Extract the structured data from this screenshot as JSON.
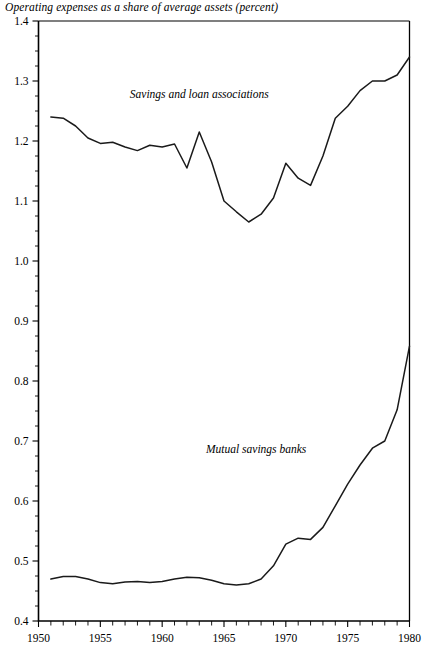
{
  "chart_data": {
    "type": "line",
    "title": "Operating expenses as a share of average assets (percent)",
    "xlabel": "",
    "ylabel": "",
    "xlim": [
      1950,
      1980
    ],
    "ylim": [
      0.4,
      1.4
    ],
    "grid": false,
    "legend_position": "inline-annotations",
    "x_ticks_major": [
      1950,
      1955,
      1960,
      1965,
      1970,
      1975,
      1980
    ],
    "x_tick_labels": [
      "1950",
      "1955",
      "1960",
      "1965",
      "1970",
      "1975",
      "1980"
    ],
    "x_tick_interval_minor": 1,
    "y_ticks_major": [
      0.4,
      0.5,
      0.6,
      0.7,
      0.8,
      0.9,
      1.0,
      1.1,
      1.2,
      1.3,
      1.4
    ],
    "y_tick_labels": [
      "0.4",
      "0.5",
      "0.6",
      "0.7",
      "0.8",
      "0.9",
      "1.0",
      "1.1",
      "1.2",
      "1.3",
      "1.4"
    ],
    "y_tick_interval_minor": 0.025,
    "series": [
      {
        "name": "Savings and loan associations",
        "annotation": "Savings and loan associations",
        "annotation_x": 1963.0,
        "annotation_y": 1.272,
        "color": "#1a1a1a",
        "x": [
          1951,
          1952,
          1953,
          1954,
          1955,
          1956,
          1957,
          1958,
          1959,
          1960,
          1961,
          1962,
          1963,
          1964,
          1965,
          1966,
          1967,
          1968,
          1969,
          1970,
          1971,
          1972,
          1973,
          1974,
          1975,
          1976,
          1977,
          1978,
          1979,
          1980
        ],
        "values": [
          1.24,
          1.238,
          1.225,
          1.205,
          1.196,
          1.198,
          1.19,
          1.184,
          1.193,
          1.19,
          1.195,
          1.155,
          1.215,
          1.165,
          1.1,
          1.082,
          1.065,
          1.078,
          1.105,
          1.163,
          1.138,
          1.126,
          1.175,
          1.238,
          1.258,
          1.284,
          1.3,
          1.3,
          1.31,
          1.34
        ]
      },
      {
        "name": "Mutual savings banks",
        "annotation": "Mutual savings banks",
        "annotation_x": 1967.6,
        "annotation_y": 0.68,
        "color": "#1a1a1a",
        "x": [
          1951,
          1952,
          1953,
          1954,
          1955,
          1956,
          1957,
          1958,
          1959,
          1960,
          1961,
          1962,
          1963,
          1964,
          1965,
          1966,
          1967,
          1968,
          1969,
          1970,
          1971,
          1972,
          1973,
          1974,
          1975,
          1976,
          1977,
          1978,
          1979,
          1980
        ],
        "values": [
          0.47,
          0.474,
          0.474,
          0.47,
          0.464,
          0.462,
          0.465,
          0.466,
          0.464,
          0.466,
          0.47,
          0.473,
          0.472,
          0.468,
          0.462,
          0.46,
          0.462,
          0.47,
          0.492,
          0.528,
          0.538,
          0.536,
          0.556,
          0.592,
          0.628,
          0.66,
          0.688,
          0.7,
          0.752,
          0.858
        ]
      }
    ]
  }
}
